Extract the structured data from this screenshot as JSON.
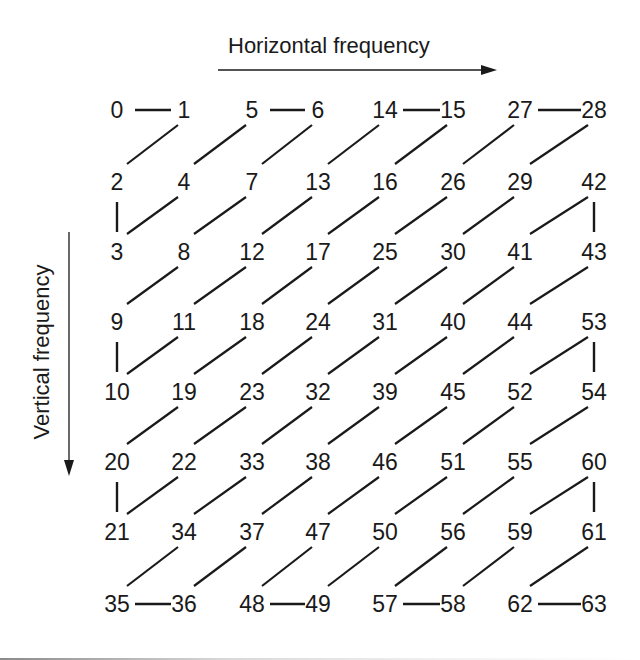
{
  "diagram": {
    "title_horizontal": "Horizontal frequency",
    "title_vertical": "Vertical frequency",
    "grid_size": 8,
    "columns_x": [
      117,
      184,
      252,
      318,
      385,
      453,
      520,
      594
    ],
    "rows_y": [
      110,
      182,
      252,
      322,
      392,
      462,
      532,
      604
    ],
    "grid": [
      [
        0,
        1,
        5,
        6,
        14,
        15,
        27,
        28
      ],
      [
        2,
        4,
        7,
        13,
        16,
        26,
        29,
        42
      ],
      [
        3,
        8,
        12,
        17,
        25,
        30,
        41,
        43
      ],
      [
        9,
        11,
        18,
        24,
        31,
        40,
        44,
        53
      ],
      [
        10,
        19,
        23,
        32,
        39,
        45,
        52,
        54
      ],
      [
        20,
        22,
        33,
        38,
        46,
        51,
        55,
        60
      ],
      [
        21,
        34,
        37,
        47,
        50,
        56,
        59,
        61
      ],
      [
        35,
        36,
        48,
        49,
        57,
        58,
        62,
        63
      ]
    ],
    "line_color": "#1a1a1a",
    "arrow_color": "#1a1a1a"
  }
}
